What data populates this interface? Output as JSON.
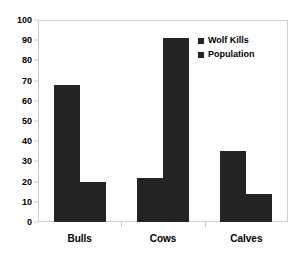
{
  "chart_data": {
    "type": "bar",
    "title": "",
    "subtitle": "",
    "xlabel": "",
    "ylabel": "",
    "categories": [
      "Bulls",
      "Cows",
      "Calves"
    ],
    "series": [
      {
        "name": "Wolf Kills",
        "values": [
          68,
          22,
          35
        ],
        "color": "#232323"
      },
      {
        "name": "Population",
        "values": [
          20,
          91,
          14
        ],
        "color": "#232323"
      }
    ],
    "ylim": [
      0,
      100
    ],
    "ytick_step": 10,
    "yticks": [
      0,
      10,
      20,
      30,
      40,
      50,
      60,
      70,
      80,
      90,
      100
    ],
    "ytick_labels": [
      "0",
      "10",
      "20",
      "30",
      "40",
      "50",
      "60",
      "70",
      "80",
      "90",
      "100"
    ],
    "grid": false,
    "legend_position": "top-right-inside",
    "annotations": []
  },
  "legend": {
    "entries": [
      {
        "label": "Wolf Kills",
        "marker": "square-swatch"
      },
      {
        "label": "Population",
        "marker": "square-swatch"
      }
    ]
  },
  "colors": {
    "bar_fill": "#232323",
    "plot_border": "#d2d2d2",
    "axis_text": "#000000",
    "background": "#ffffff"
  }
}
